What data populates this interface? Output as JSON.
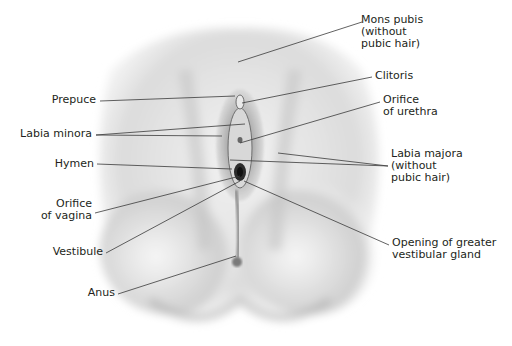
{
  "diagram": {
    "type": "anatomical-illustration",
    "labels": [
      {
        "id": "mons_pubis",
        "text": "Mons pubis\n(without\npubic hair)",
        "x": 361,
        "y": 14,
        "align": "left",
        "anchor": [
          362,
          22
        ],
        "target": [
          238,
          62
        ]
      },
      {
        "id": "clitoris",
        "text": "Clitoris",
        "x": 375,
        "y": 70,
        "align": "left",
        "anchor": [
          372,
          77
        ],
        "target": [
          242,
          103
        ]
      },
      {
        "id": "orifice_urethra",
        "text": "Orifice\nof urethra",
        "x": 383,
        "y": 94,
        "align": "left",
        "anchor": [
          380,
          102
        ],
        "target": [
          240,
          143
        ]
      },
      {
        "id": "labia_majora",
        "text": "Labia majora\n(without\npubic hair)",
        "x": 391,
        "y": 148,
        "align": "left",
        "anchor": [
          388,
          166
        ],
        "targets": [
          [
            278,
            153
          ],
          [
            230,
            160
          ]
        ]
      },
      {
        "id": "opening_gland",
        "text": "Opening of greater\nvestibular gland",
        "x": 392,
        "y": 237,
        "align": "left",
        "anchor": [
          389,
          245
        ],
        "target": [
          244,
          181
        ]
      },
      {
        "id": "prepuce",
        "text": "Prepuce",
        "x": 16,
        "y": 94,
        "align": "right",
        "anchor": [
          100,
          101
        ],
        "target": [
          235,
          96
        ]
      },
      {
        "id": "labia_minora",
        "text": "Labia minora",
        "x": 8,
        "y": 128,
        "align": "right",
        "anchor": [
          96,
          135
        ],
        "targets": [
          [
            245,
            124
          ],
          [
            222,
            136
          ]
        ]
      },
      {
        "id": "hymen",
        "text": "Hymen",
        "x": 34,
        "y": 158,
        "align": "right",
        "anchor": [
          97,
          164
        ],
        "target": [
          232,
          169
        ]
      },
      {
        "id": "orifice_vagina",
        "text": "Orifice\nof vagina",
        "x": 24,
        "y": 198,
        "align": "right",
        "anchor": [
          95,
          213
        ],
        "target": [
          240,
          176
        ]
      },
      {
        "id": "vestibule",
        "text": "Vestibule",
        "x": 26,
        "y": 246,
        "align": "right",
        "anchor": [
          106,
          253
        ],
        "target": [
          240,
          181
        ]
      },
      {
        "id": "anus",
        "text": "Anus",
        "x": 84,
        "y": 287,
        "align": "right",
        "anchor": [
          118,
          294
        ],
        "target": [
          236,
          256
        ]
      }
    ]
  },
  "colors": {
    "background": "#ffffff",
    "text": "#231f20",
    "leader_line": "#3a3a3a",
    "skin_light": "#f4f4f4",
    "skin_mid": "#d6d6d6",
    "skin_shadow": "#9a9a9a"
  }
}
